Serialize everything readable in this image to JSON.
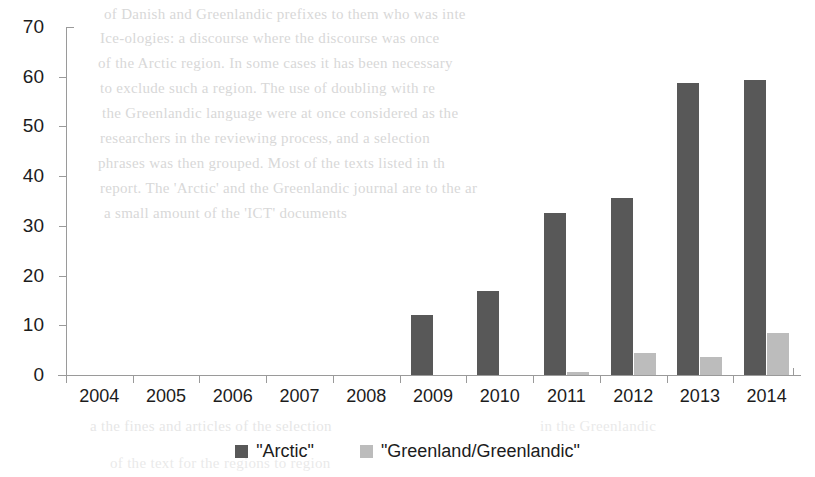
{
  "chart_data": {
    "type": "bar",
    "title": "",
    "subtitle": "",
    "xlabel": "",
    "ylabel": "",
    "categories": [
      "2004",
      "2005",
      "2006",
      "2007",
      "2008",
      "2009",
      "2010",
      "2011",
      "2012",
      "2013",
      "2014"
    ],
    "series": [
      {
        "name": "\"Arctic\"",
        "color": "#585858",
        "values": [
          0,
          0,
          0,
          0,
          0,
          12.0,
          16.8,
          32.6,
          35.6,
          58.7,
          59.4
        ]
      },
      {
        "name": "\"Greenland/Greenlandic\"",
        "color": "#bcbcbc",
        "values": [
          0,
          0,
          0,
          0,
          0,
          0,
          0,
          0.7,
          4.5,
          3.6,
          8.5
        ]
      }
    ],
    "ylim": [
      0,
      70
    ],
    "ytick_values": [
      0,
      10,
      20,
      30,
      40,
      50,
      60,
      70
    ],
    "ytick_labels": [
      "0",
      "10",
      "20",
      "30",
      "40",
      "50",
      "60",
      "70"
    ],
    "grid": false,
    "legend_position": "bottom"
  },
  "legend": {
    "entries": [
      {
        "label": "\"Arctic\"",
        "swatch": "legend-swatch-arctic"
      },
      {
        "label": "\"Greenland/Greenlandic\"",
        "swatch": "legend-swatch-greenland"
      }
    ]
  },
  "background_text": {
    "lines": [
      "of Danish and Greenlandic prefixes to them who was inte",
      "Ice-ologies: a discourse where the discourse was once",
      "of the Arctic region. In some cases it has been necessary",
      "to exclude such a region. The use of doubling with re",
      "the Greenlandic language were at once considered as the",
      "researchers in the reviewing process, and a selection",
      "phrases was then grouped. Most of the texts listed in th",
      "report. The 'Arctic' and the Greenlandic journal are to the ar",
      "a small amount of the 'ICT' documents"
    ],
    "lower_lines": [
      "a the fines and articles of the selection",
      "in the Greenlandic",
      "of the text for the regions to region"
    ]
  }
}
